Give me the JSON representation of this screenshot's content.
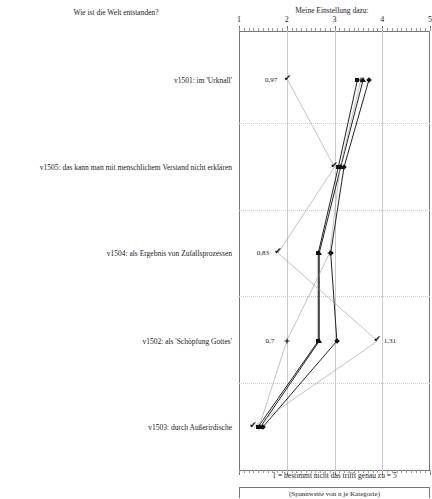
{
  "header": {
    "left_title": "Wie ist die Welt entstanden?",
    "right_title": "Meine Einstellung dazu:"
  },
  "footer": {
    "scale_note": "1 = bestimmt nicht      das trifft genau zu = 5",
    "range_note": "(Spannweite von n je Kategorie)"
  },
  "axis": {
    "ticks": [
      "1",
      "2",
      "3",
      "4",
      "5"
    ],
    "min": 1,
    "max": 5
  },
  "rows": [
    {
      "id": "v1501",
      "label": "v1501: im 'Urknall'"
    },
    {
      "id": "v1505",
      "label": "v1505: das kann man mit menschlichem Verstand nicht erklären"
    },
    {
      "id": "v1504",
      "label": "v1504: als Ergebnis von Zufallsprozessen"
    },
    {
      "id": "v1502",
      "label": "v1502: als 'Schöpfung Gottes'"
    },
    {
      "id": "v1503",
      "label": "v1503: durch Außerirdische"
    }
  ],
  "annotations": [
    {
      "text": "0,97",
      "row": "v1501"
    },
    {
      "text": "0,83",
      "row": "v1504"
    },
    {
      "text": "0,7",
      "row": "v1502"
    },
    {
      "text": "1,31",
      "row": "v1502"
    }
  ],
  "chart_data": {
    "type": "line",
    "title": "Wie ist die Welt entstanden?",
    "subtitle": "Meine Einstellung dazu:",
    "xlabel": "1 = bestimmt nicht      das trifft genau zu = 5",
    "ylabel": "",
    "xlim": [
      1,
      5
    ],
    "grid": true,
    "legend": "none",
    "categories": [
      "v1501: im 'Urknall'",
      "v1505: das kann man mit menschlichem Verstand nicht erklären",
      "v1504: als Ergebnis von Zufallsprozessen",
      "v1502: als 'Schöpfung Gottes'",
      "v1503: durch Außerirdische"
    ],
    "series": [
      {
        "name": "Mittelwert (Quadrat)",
        "marker": "square",
        "values": [
          3.48,
          3.08,
          2.66,
          2.66,
          1.4
        ]
      },
      {
        "name": "Median (Dreieck)",
        "marker": "triangle",
        "values": [
          3.6,
          3.13,
          2.68,
          2.68,
          1.45
        ]
      },
      {
        "name": "Modus (Raute)",
        "marker": "diamond",
        "values": [
          3.72,
          3.2,
          2.92,
          3.05,
          1.5
        ]
      },
      {
        "name": "Streuung (Haken)",
        "marker": "check",
        "values": [
          2.02,
          3.0,
          1.82,
          3.9,
          1.3
        ]
      },
      {
        "name": "Spannweite (Plus)",
        "marker": "plus",
        "values": [
          3.55,
          3.12,
          2.9,
          2.0,
          1.42
        ]
      }
    ],
    "annotations": [
      {
        "label": "0,97",
        "x": 1.92,
        "category": "v1501: im 'Urknall'"
      },
      {
        "label": "0,83",
        "x": 1.75,
        "category": "v1504: als Ergebnis von Zufallsprozessen"
      },
      {
        "label": "0,7",
        "x": 1.93,
        "category": "v1502: als 'Schöpfung Gottes'"
      },
      {
        "label": "1,31",
        "x": 3.95,
        "category": "v1502: als 'Schöpfung Gottes'"
      }
    ]
  }
}
